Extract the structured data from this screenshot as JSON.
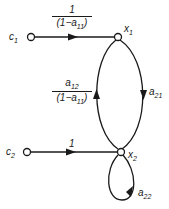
{
  "diagram": {
    "type": "signal-flow-graph",
    "nodes": [
      {
        "id": "c1",
        "label": "c",
        "sub": "1",
        "x": 31,
        "y": 37
      },
      {
        "id": "x1",
        "label": "x",
        "sub": "1",
        "x": 118,
        "y": 37
      },
      {
        "id": "c2",
        "label": "c",
        "sub": "2",
        "x": 27,
        "y": 152
      },
      {
        "id": "x2",
        "label": "x",
        "sub": "2",
        "x": 121,
        "y": 152
      }
    ],
    "edges": [
      {
        "from": "c1",
        "to": "x1",
        "gain_num": "1",
        "gain_den": "(1−a",
        "gain_den_sub": "11",
        "gain_den_tail": ")"
      },
      {
        "from": "x1",
        "to": "x2",
        "gain": "a",
        "gain_sub": "21"
      },
      {
        "from": "x2",
        "to": "x1",
        "gain_num": "a",
        "gain_num_sub": "12",
        "gain_den": "(1−a",
        "gain_den_sub": "11",
        "gain_den_tail": ")"
      },
      {
        "from": "c2",
        "to": "x2",
        "gain": "1"
      },
      {
        "from": "x2",
        "to": "x2",
        "gain": "a",
        "gain_sub": "22"
      }
    ]
  }
}
